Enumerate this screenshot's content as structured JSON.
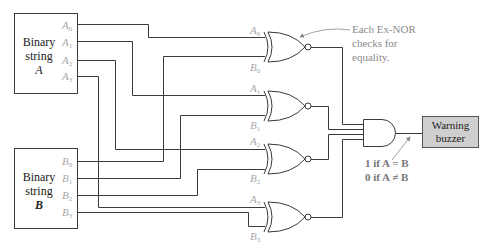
{
  "diagram": {
    "box_a": {
      "line1": "Binary",
      "line2": "string",
      "line3": "A"
    },
    "box_b": {
      "line1": "Binary",
      "line2": "string",
      "line3": "B"
    },
    "a_pins": [
      {
        "base": "A",
        "sub": "0"
      },
      {
        "base": "A",
        "sub": "1"
      },
      {
        "base": "A",
        "sub": "2"
      },
      {
        "base": "A",
        "sub": "3"
      }
    ],
    "b_pins": [
      {
        "base": "B",
        "sub": "0"
      },
      {
        "base": "B",
        "sub": "1"
      },
      {
        "base": "B",
        "sub": "2"
      },
      {
        "base": "B",
        "sub": "3"
      }
    ],
    "gates": [
      {
        "type": "XNOR",
        "in_a": {
          "base": "A",
          "sub": "0"
        },
        "in_b": {
          "base": "B",
          "sub": "0"
        }
      },
      {
        "type": "XNOR",
        "in_a": {
          "base": "A",
          "sub": "1"
        },
        "in_b": {
          "base": "B",
          "sub": "1"
        }
      },
      {
        "type": "XNOR",
        "in_a": {
          "base": "A",
          "sub": "2"
        },
        "in_b": {
          "base": "B",
          "sub": "2"
        }
      },
      {
        "type": "XNOR",
        "in_a": {
          "base": "A",
          "sub": "3"
        },
        "in_b": {
          "base": "B",
          "sub": "3"
        }
      }
    ],
    "and_gate": {
      "type": "AND",
      "inputs": 4
    },
    "annotation": {
      "line1": "Each Ex-NOR",
      "line2": "checks for",
      "line3": "equality."
    },
    "output_note": {
      "line1": "1 if A = B",
      "line2": "0 if A ≠ B"
    },
    "buzzer": {
      "line1": "Warning",
      "line2": "buzzer"
    },
    "colors": {
      "wire": "#3a3a3a",
      "pin_label": "#a8a8a8",
      "annotation": "#8a8a8a",
      "buzzer_fill": "#cfcfcf"
    }
  }
}
